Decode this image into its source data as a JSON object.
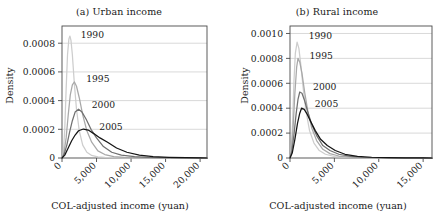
{
  "figure": {
    "panels": [
      "a",
      "b"
    ]
  },
  "chart_data": [
    {
      "type": "line",
      "panel_id": "a",
      "title": "(a) Urban income",
      "xlabel": "COL-adjusted income (yuan)",
      "ylabel": "Density",
      "xlim": [
        0,
        21000
      ],
      "ylim": [
        0,
        0.00092
      ],
      "grid": true,
      "legend_position": "inline-annotations",
      "xticks": [
        0,
        5000,
        10000,
        15000,
        20000
      ],
      "xticklabels": [
        "0",
        "5,000",
        "10,000",
        "15,000",
        "20,000"
      ],
      "yticks": [
        0,
        0.0002,
        0.0004,
        0.0006,
        0.0008
      ],
      "yticklabels": [
        "0",
        "0.0002",
        "0.0004",
        "0.0006",
        "0.0008"
      ],
      "series": [
        {
          "name": "1990",
          "color": "#cdcdcd",
          "label_x": 2700,
          "label_y": 0.00086,
          "peak_x": 1150,
          "peak_y": 0.00085,
          "x": [
            0,
            200,
            400,
            600,
            800,
            1000,
            1150,
            1300,
            1500,
            1800,
            2100,
            2500,
            3000,
            3600,
            4300,
            5200,
            6200,
            7500,
            9000,
            11000,
            13500,
            16000,
            19000,
            21000
          ],
          "values": [
            0.0,
            4e-05,
            0.0002,
            0.00048,
            0.00072,
            0.00083,
            0.00085,
            0.00082,
            0.00072,
            0.00051,
            0.00034,
            0.00019,
            9e-05,
            4e-05,
            1.8e-05,
            8e-06,
            4e-06,
            2e-06,
            1e-06,
            5e-07,
            2e-07,
            1e-07,
            5e-08,
            0.0
          ]
        },
        {
          "name": "1995",
          "color": "#a8a8a8",
          "label_x": 3500,
          "label_y": 0.00055,
          "peak_x": 1800,
          "peak_y": 0.00053,
          "x": [
            0,
            300,
            600,
            900,
            1200,
            1500,
            1800,
            2100,
            2500,
            3000,
            3600,
            4300,
            5200,
            6200,
            7500,
            9000,
            11000,
            13500,
            16000,
            19000,
            21000
          ],
          "values": [
            0.0,
            4e-05,
            0.00014,
            0.0003,
            0.00044,
            0.00051,
            0.00053,
            0.0005,
            0.00042,
            0.0003,
            0.00019,
            0.00011,
            5e-05,
            2.4e-05,
            1e-05,
            5e-06,
            2e-06,
            1e-06,
            5e-07,
            2e-07,
            0.0
          ]
        },
        {
          "name": "2000",
          "color": "#707070",
          "label_x": 4300,
          "label_y": 0.00037,
          "peak_x": 2400,
          "peak_y": 0.00034,
          "x": [
            0,
            300,
            700,
            1100,
            1500,
            1900,
            2400,
            2900,
            3500,
            4200,
            5000,
            6000,
            7200,
            8600,
            10500,
            12500,
            15000,
            17500,
            20000,
            21000
          ],
          "values": [
            0.0,
            2.5e-05,
            9e-05,
            0.00018,
            0.00026,
            0.00032,
            0.00034,
            0.00032,
            0.00027,
            0.0002,
            0.00014,
            8e-05,
            4e-05,
            2e-05,
            9e-06,
            4e-06,
            1.8e-06,
            8e-07,
            3e-07,
            0.0
          ]
        },
        {
          "name": "2005",
          "color": "#141414",
          "label_x": 5400,
          "label_y": 0.000215,
          "peak_x": 3100,
          "peak_y": 0.000202,
          "x": [
            0,
            400,
            900,
            1400,
            1900,
            2400,
            3100,
            3800,
            4600,
            5500,
            6600,
            7900,
            9400,
            11200,
            13200,
            15500,
            18000,
            20000,
            21000
          ],
          "values": [
            0.0,
            2e-05,
            7e-05,
            0.00012,
            0.00016,
            0.00019,
            0.000202,
            0.000195,
            0.00017,
            0.00014,
            0.00011,
            7e-05,
            4e-05,
            2e-05,
            1e-05,
            5e-06,
            2e-06,
            1e-06,
            0.0
          ]
        }
      ]
    },
    {
      "type": "line",
      "panel_id": "b",
      "title": "(b) Rural income",
      "xlabel": "COL-adjusted income (yuan)",
      "ylabel": "Density",
      "xlim": [
        0,
        16000
      ],
      "ylim": [
        0,
        0.00106
      ],
      "grid": true,
      "legend_position": "inline-annotations",
      "xticks": [
        0,
        5000,
        10000,
        15000
      ],
      "xticklabels": [
        "0",
        "5,000",
        "10,000",
        "15,000"
      ],
      "yticks": [
        0,
        0.0002,
        0.0004,
        0.0006,
        0.0008,
        0.001
      ],
      "yticklabels": [
        "0",
        "0.0002",
        "0.0004",
        "0.0006",
        "0.0008",
        "0.0010"
      ],
      "series": [
        {
          "name": "1990",
          "color": "#cdcdcd",
          "label_x": 2100,
          "label_y": 0.00098,
          "peak_x": 800,
          "peak_y": 0.00093,
          "x": [
            0,
            150,
            300,
            450,
            600,
            800,
            1000,
            1200,
            1500,
            1800,
            2200,
            2700,
            3300,
            4000,
            5000,
            6200,
            7600,
            9200,
            11000,
            13000,
            15000,
            16000
          ],
          "values": [
            0.0,
            8e-05,
            0.0003,
            0.00062,
            0.00084,
            0.00093,
            0.00088,
            0.00076,
            0.00055,
            0.00038,
            0.00022,
            0.00012,
            6e-05,
            3e-05,
            1.2e-05,
            5e-06,
            2e-06,
            1e-06,
            5e-07,
            2e-07,
            1e-07,
            0.0
          ]
        },
        {
          "name": "1995",
          "color": "#a8a8a8",
          "label_x": 2200,
          "label_y": 0.00082,
          "peak_x": 900,
          "peak_y": 0.0008,
          "x": [
            0,
            150,
            350,
            550,
            750,
            900,
            1100,
            1350,
            1650,
            2000,
            2450,
            3000,
            3700,
            4500,
            5500,
            6800,
            8300,
            10000,
            12000,
            14000,
            16000
          ],
          "values": [
            0.0,
            6e-05,
            0.00024,
            0.00052,
            0.00073,
            0.0008,
            0.00077,
            0.00068,
            0.00053,
            0.00038,
            0.00024,
            0.00014,
            7e-05,
            3.5e-05,
            1.6e-05,
            7e-06,
            3e-06,
            1.5e-06,
            7e-07,
            3e-07,
            0.0
          ]
        },
        {
          "name": "2000",
          "color": "#707070",
          "label_x": 2600,
          "label_y": 0.00057,
          "peak_x": 1100,
          "peak_y": 0.00053,
          "x": [
            0,
            200,
            450,
            700,
            900,
            1100,
            1350,
            1650,
            2000,
            2450,
            3000,
            3700,
            4500,
            5500,
            6800,
            8300,
            10000,
            12000,
            14000,
            16000
          ],
          "values": [
            0.0,
            5e-05,
            0.00019,
            0.00036,
            0.00047,
            0.00053,
            0.00052,
            0.00046,
            0.00037,
            0.00027,
            0.00018,
            0.0001,
            6e-05,
            3e-05,
            1.3e-05,
            6e-06,
            3e-06,
            1.2e-06,
            5e-07,
            0.0
          ]
        },
        {
          "name": "2005",
          "color": "#141414",
          "label_x": 2800,
          "label_y": 0.00043,
          "peak_x": 1300,
          "peak_y": 0.0004,
          "x": [
            0,
            250,
            550,
            850,
            1100,
            1300,
            1600,
            1950,
            2350,
            2850,
            3450,
            4200,
            5100,
            6200,
            7600,
            9200,
            11000,
            13000,
            15000,
            16000
          ],
          "values": [
            0.0,
            4e-05,
            0.00015,
            0.00028,
            0.00036,
            0.0004,
            0.00039,
            0.00035,
            0.00029,
            0.00022,
            0.00015,
            0.0001,
            6e-05,
            3e-05,
            1.4e-05,
            6e-06,
            3e-06,
            1.2e-06,
            5e-07,
            0.0
          ]
        }
      ]
    }
  ]
}
